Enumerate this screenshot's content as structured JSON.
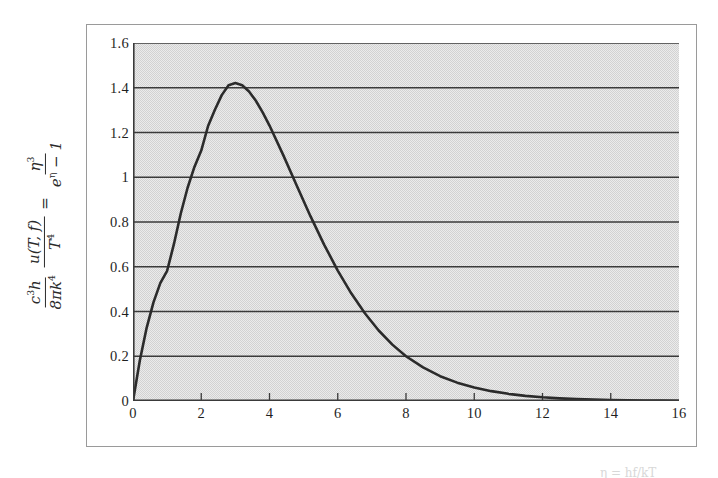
{
  "figure": {
    "background_color": "#ffffff",
    "frame_color": "#9a9a9a",
    "plot_background_color": "#d2d2d2",
    "gridline_color": "#3a3a3a",
    "curve_color": "#2b2b2b"
  },
  "y_axis_label": {
    "lhs_numerator": "c",
    "lhs_numerator_exp": "3",
    "lhs_numerator_h": "h",
    "lhs_denominator": "8πk",
    "lhs_denominator_exp": "4",
    "mid_numerator": "u(T, f)",
    "mid_denominator": "T",
    "mid_denominator_exp": "4",
    "equals": "=",
    "rhs_numerator": "η",
    "rhs_numerator_exp": "3",
    "rhs_denominator_e": "e",
    "rhs_denominator_exp": "η",
    "rhs_denominator_tail": "− 1",
    "plain": "c³h / 8πk⁴ · u(T,f) / T⁴ = η³ / (e^η − 1)"
  },
  "bottom_caption": {
    "text": "η = hf/kT"
  },
  "chart_data": {
    "type": "line",
    "title": "",
    "subtitle": "",
    "xlabel": "",
    "ylabel": "c³h/(8πk⁴) · u(T,f)/T⁴ = η³/(e^η − 1)",
    "xlim": [
      0,
      16
    ],
    "ylim": [
      0,
      1.6
    ],
    "xticks": [
      0,
      2,
      4,
      6,
      8,
      10,
      12,
      14,
      16
    ],
    "xtick_labels": [
      "0",
      "2",
      "4",
      "6",
      "8",
      "10",
      "12",
      "14",
      "16"
    ],
    "yticks": [
      0,
      0.2,
      0.4,
      0.6,
      0.8,
      1,
      1.2,
      1.4,
      1.6
    ],
    "ytick_labels": [
      "0",
      "0.2",
      "0.4",
      "0.6",
      "0.8",
      "1",
      "1.2",
      "1.4",
      "1.6"
    ],
    "grid": "horizontal",
    "legend": "none",
    "series": [
      {
        "name": "η³/(e^η − 1)",
        "color": "#2b2b2b",
        "line_width": 2.6,
        "peak_x": 2.82,
        "peak_y": 1.421,
        "x": [
          0,
          0.2,
          0.4,
          0.6,
          0.8,
          1,
          1.2,
          1.4,
          1.6,
          1.8,
          2,
          2.2,
          2.4,
          2.6,
          2.8,
          3,
          3.2,
          3.4,
          3.6,
          3.8,
          4,
          4.4,
          4.8,
          5.2,
          5.6,
          6,
          6.4,
          6.8,
          7.2,
          7.6,
          8,
          8.5,
          9,
          9.5,
          10,
          10.5,
          11,
          11.5,
          12,
          12.5,
          13,
          13.5,
          14,
          14.5,
          15,
          15.5,
          16
        ],
        "y": [
          0,
          0.181,
          0.327,
          0.441,
          0.527,
          0.582,
          0.702,
          0.838,
          0.953,
          1.046,
          1.119,
          1.229,
          1.302,
          1.367,
          1.411,
          1.421,
          1.411,
          1.383,
          1.342,
          1.29,
          1.231,
          1.1,
          0.962,
          0.826,
          0.699,
          0.583,
          0.48,
          0.391,
          0.315,
          0.252,
          0.2,
          0.15,
          0.111,
          0.082,
          0.06,
          0.044,
          0.032,
          0.023,
          0.0166,
          0.0119,
          0.0085,
          0.0061,
          0.0043,
          0.0031,
          0.0022,
          0.0015,
          0.0011
        ]
      }
    ]
  }
}
